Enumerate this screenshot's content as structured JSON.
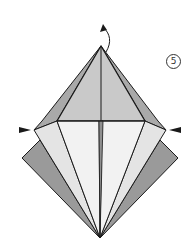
{
  "diagram": {
    "step_number": "5",
    "colors": {
      "background": "#ffffff",
      "top_face": "#c9c9c9",
      "top_side_face": "#a9a9a9",
      "lower_light_face": "#f2f2f2",
      "lower_mid_face": "#e4e4e4",
      "back_flap": "#9a9a9a",
      "center_strip": "#8f8f8f",
      "line": "#1a1a1a"
    },
    "symbols": [
      {
        "name": "fold-up-arrow",
        "meaning": "lift top point up"
      },
      {
        "name": "push-left-arrow",
        "meaning": "push in from left"
      },
      {
        "name": "push-right-arrow",
        "meaning": "push in from right"
      }
    ]
  }
}
